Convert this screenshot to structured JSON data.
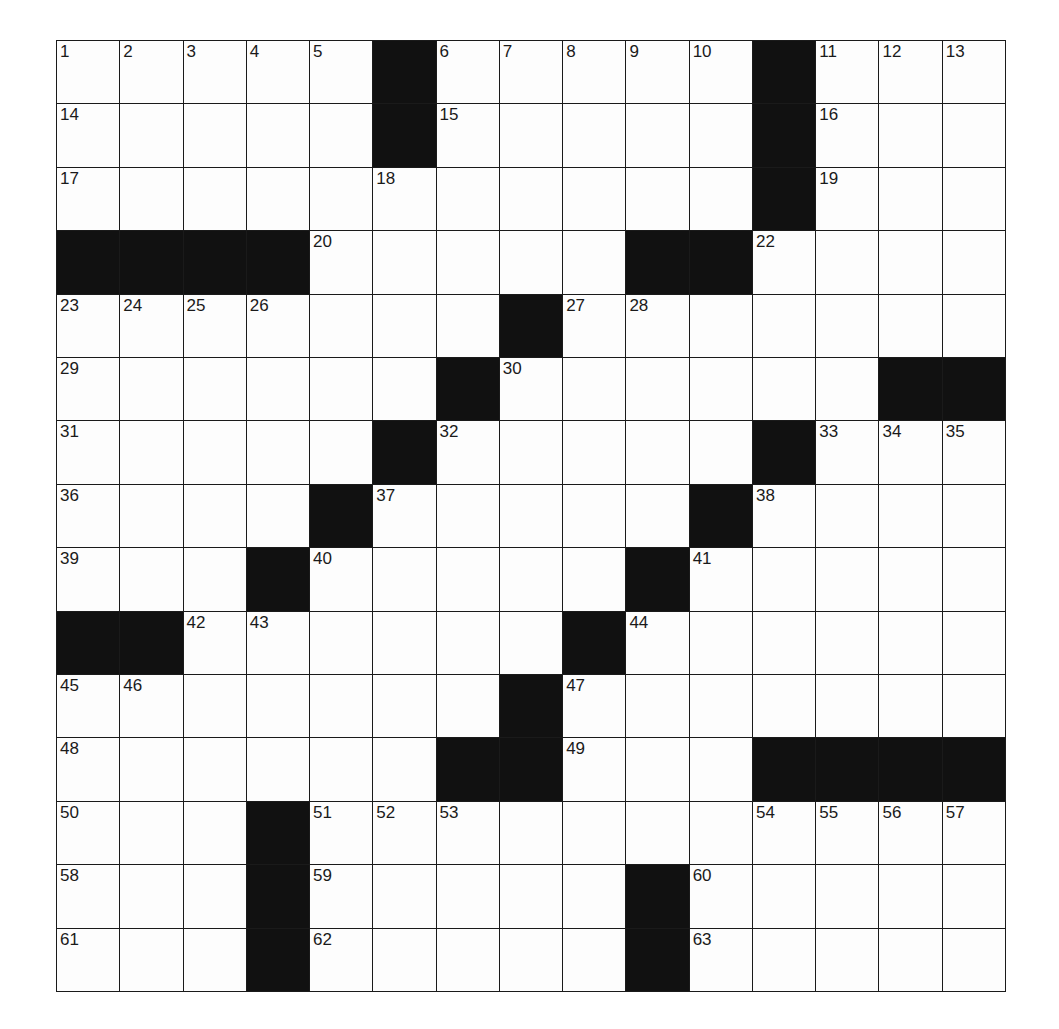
{
  "puzzle": {
    "rows": 15,
    "cols": 15,
    "grid": [
      ".....#.....#...",
      ".....#.....#...",
      "...........#...",
      "####.....##....",
      ".......#.......",
      "......#......##",
      ".....#.....#...",
      "....#.....#....",
      "...#.....#.....",
      "##......#......",
      ".......#.......",
      "......##...####",
      "...#...........",
      "...#.....#.....",
      "...#.....#....."
    ],
    "numbers": [
      [
        1,
        2,
        3,
        4,
        5,
        0,
        6,
        7,
        8,
        9,
        10,
        0,
        11,
        12,
        13
      ],
      [
        14,
        0,
        0,
        0,
        0,
        0,
        15,
        0,
        0,
        0,
        0,
        0,
        16,
        0,
        0
      ],
      [
        17,
        0,
        0,
        0,
        0,
        18,
        0,
        0,
        0,
        0,
        0,
        0,
        19,
        0,
        0
      ],
      [
        0,
        0,
        0,
        0,
        20,
        0,
        0,
        0,
        0,
        0,
        21,
        22,
        0,
        0,
        0
      ],
      [
        23,
        24,
        25,
        26,
        0,
        0,
        0,
        0,
        27,
        28,
        0,
        0,
        0,
        0,
        0
      ],
      [
        29,
        0,
        0,
        0,
        0,
        0,
        0,
        30,
        0,
        0,
        0,
        0,
        0,
        0,
        0
      ],
      [
        31,
        0,
        0,
        0,
        0,
        0,
        32,
        0,
        0,
        0,
        0,
        0,
        33,
        34,
        35
      ],
      [
        36,
        0,
        0,
        0,
        0,
        37,
        0,
        0,
        0,
        0,
        0,
        38,
        0,
        0,
        0
      ],
      [
        39,
        0,
        0,
        0,
        40,
        0,
        0,
        0,
        0,
        0,
        41,
        0,
        0,
        0,
        0
      ],
      [
        0,
        0,
        42,
        43,
        0,
        0,
        0,
        0,
        0,
        44,
        0,
        0,
        0,
        0,
        0
      ],
      [
        45,
        46,
        0,
        0,
        0,
        0,
        0,
        0,
        47,
        0,
        0,
        0,
        0,
        0,
        0
      ],
      [
        48,
        0,
        0,
        0,
        0,
        0,
        0,
        0,
        49,
        0,
        0,
        0,
        0,
        0,
        0
      ],
      [
        50,
        0,
        0,
        0,
        51,
        52,
        53,
        0,
        0,
        0,
        0,
        54,
        55,
        56,
        57
      ],
      [
        58,
        0,
        0,
        0,
        59,
        0,
        0,
        0,
        0,
        0,
        60,
        0,
        0,
        0,
        0
      ],
      [
        61,
        0,
        0,
        0,
        62,
        0,
        0,
        0,
        0,
        0,
        63,
        0,
        0,
        0,
        0
      ]
    ],
    "colors": {
      "black": "#111111",
      "white": "#fdfdfd",
      "line": "#1a1a1a"
    }
  }
}
